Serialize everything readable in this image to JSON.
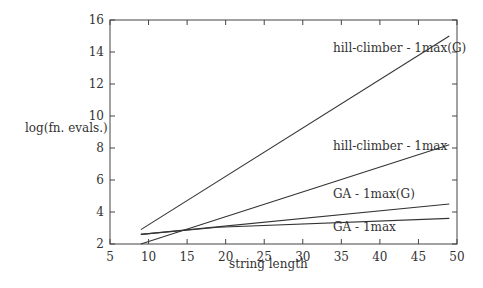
{
  "chart_data": {
    "type": "line",
    "title": "",
    "xlabel": "string length",
    "ylabel": "log(fn. evals.)",
    "xlim": [
      5,
      50
    ],
    "ylim": [
      2,
      16
    ],
    "xticks": [
      5,
      10,
      15,
      20,
      25,
      30,
      35,
      40,
      45,
      50
    ],
    "yticks": [
      2,
      4,
      6,
      8,
      10,
      12,
      14,
      16
    ],
    "grid": false,
    "legend_position": "inline labels near line ends",
    "series": [
      {
        "name": "hill-climber - 1max(G)",
        "x": [
          9,
          49
        ],
        "y": [
          2.9,
          15.0
        ]
      },
      {
        "name": "hill-climber - 1max",
        "x": [
          9,
          49
        ],
        "y": [
          2.0,
          8.2
        ]
      },
      {
        "name": "GA - 1max(G)",
        "x": [
          9,
          49
        ],
        "y": [
          2.6,
          4.5
        ]
      },
      {
        "name": "GA - 1max",
        "x": [
          9,
          19,
          49
        ],
        "y": [
          2.6,
          3.05,
          3.6
        ]
      }
    ]
  },
  "labels": {
    "xlabel": "string length",
    "ylabel": "log(fn. evals.)",
    "s0": "hill-climber - 1max(G)",
    "s1": "hill-climber - 1max",
    "s2": "GA - 1max(G)",
    "s3": "GA - 1max"
  }
}
